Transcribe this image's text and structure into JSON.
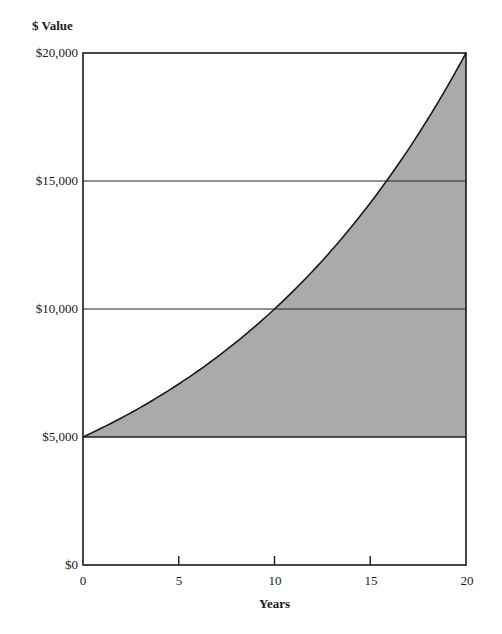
{
  "chart_data": {
    "type": "area",
    "title": "",
    "xlabel": "Years",
    "ylabel": "$ Value",
    "xlim": [
      0,
      20
    ],
    "ylim": [
      0,
      20000
    ],
    "x_ticks": [
      "0",
      "5",
      "10",
      "15",
      "20"
    ],
    "y_ticks": [
      "$0",
      "$5,000",
      "$10,000",
      "$15,000",
      "$20,000"
    ],
    "gridlines_y": [
      5000,
      10000,
      15000
    ],
    "legend": null,
    "fill_color": "#aaaaaa",
    "series": [
      {
        "name": "Investment value (compound growth)",
        "x": [
          0,
          2,
          4,
          6,
          8,
          10,
          12,
          14,
          16,
          18,
          20
        ],
        "values": [
          5000,
          5743,
          6598,
          7579,
          8706,
          10000,
          11487,
          13195,
          15157,
          17411,
          20000
        ]
      },
      {
        "name": "Initial principal",
        "x": [
          0,
          20
        ],
        "values": [
          5000,
          5000
        ]
      }
    ],
    "shaded_region": "between principal ($5,000) and growth curve"
  },
  "labels": {
    "ylabel": "$ Value",
    "xlabel": "Years",
    "y_ticks": [
      "$20,000",
      "$15,000",
      "$10,000",
      "$5,000",
      "$0"
    ],
    "x_ticks": [
      "0",
      "5",
      "10",
      "15",
      "20"
    ]
  }
}
